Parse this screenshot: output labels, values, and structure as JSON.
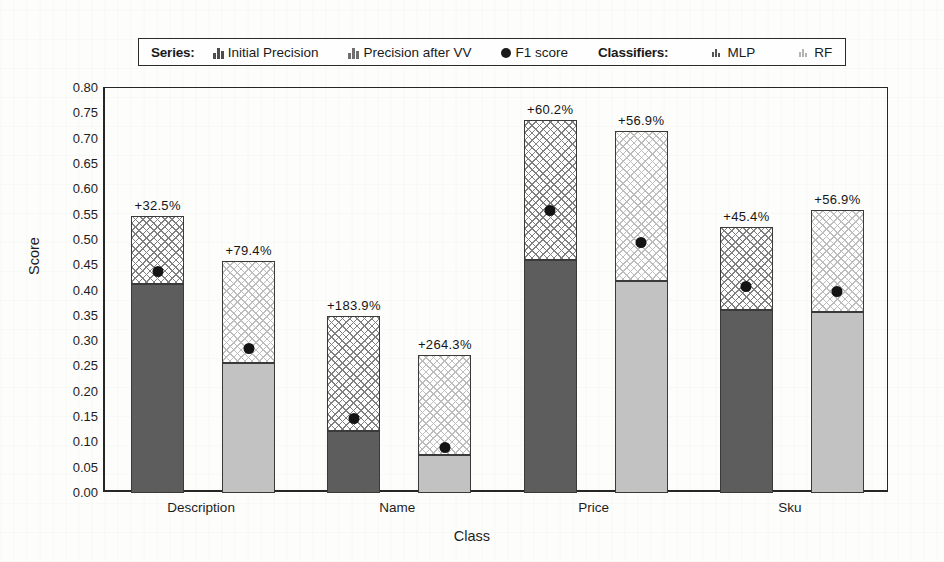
{
  "legend": {
    "series_title": "Series:",
    "classifiers_title": "Classifiers:",
    "series_entries": [
      {
        "label": "Initial Precision",
        "icon": "bar-chart-dark-icon"
      },
      {
        "label": "Precision after VV",
        "icon": "bar-chart-hatched-icon"
      },
      {
        "label": "F1 score",
        "icon": "filled-circle-icon"
      }
    ],
    "classifier_entries": [
      {
        "label": "MLP",
        "icon": "bar-tick-dark-icon",
        "color": "#5d5d5d"
      },
      {
        "label": "RF",
        "icon": "bar-tick-light-icon",
        "color": "#c2c2c2"
      }
    ]
  },
  "chart_data": {
    "type": "bar",
    "title": "",
    "xlabel": "Class",
    "ylabel": "Score",
    "ylim": [
      0.0,
      0.8
    ],
    "ytick_step": 0.05,
    "grid": false,
    "legend_position": "top",
    "stacked": true,
    "categories": [
      "Description",
      "Name",
      "Price",
      "Sku"
    ],
    "yticks": [
      "0.00",
      "0.05",
      "0.10",
      "0.15",
      "0.20",
      "0.25",
      "0.30",
      "0.35",
      "0.40",
      "0.45",
      "0.50",
      "0.55",
      "0.60",
      "0.65",
      "0.70",
      "0.75",
      "0.80"
    ],
    "classifiers": [
      "MLP",
      "RF"
    ],
    "series": [
      {
        "name": "Initial Precision",
        "key": "initial_precision"
      },
      {
        "name": "Precision after VV",
        "key": "precision_after_vv"
      },
      {
        "name": "F1 score",
        "key": "f1_score"
      }
    ],
    "bars": [
      {
        "category": "Description",
        "classifier": "MLP",
        "initial_precision": 0.413,
        "precision_after_vv": 0.547,
        "f1_score": 0.438,
        "growth_label": "+32.5%"
      },
      {
        "category": "Description",
        "classifier": "RF",
        "initial_precision": 0.256,
        "precision_after_vv": 0.459,
        "f1_score": 0.285,
        "growth_label": "+79.4%"
      },
      {
        "category": "Name",
        "classifier": "MLP",
        "initial_precision": 0.123,
        "precision_after_vv": 0.349,
        "f1_score": 0.148,
        "growth_label": "+183.9%"
      },
      {
        "category": "Name",
        "classifier": "RF",
        "initial_precision": 0.075,
        "precision_after_vv": 0.273,
        "f1_score": 0.09,
        "growth_label": "+264.3%"
      },
      {
        "category": "Price",
        "classifier": "MLP",
        "initial_precision": 0.46,
        "precision_after_vv": 0.737,
        "f1_score": 0.559,
        "growth_label": "+60.2%"
      },
      {
        "category": "Price",
        "classifier": "RF",
        "initial_precision": 0.418,
        "precision_after_vv": 0.716,
        "f1_score": 0.494,
        "growth_label": "+56.9%"
      },
      {
        "category": "Sku",
        "classifier": "MLP",
        "initial_precision": 0.362,
        "precision_after_vv": 0.526,
        "f1_score": 0.407,
        "growth_label": "+45.4%"
      },
      {
        "category": "Sku",
        "classifier": "RF",
        "initial_precision": 0.357,
        "precision_after_vv": 0.56,
        "f1_score": 0.398,
        "growth_label": "+56.9%"
      }
    ]
  },
  "style": {
    "mlp_solid": "#5d5d5d",
    "rf_solid": "#c2c2c2",
    "mlp_hatch": "#808080",
    "rf_hatch": "#bdbdbd",
    "axis": "#262626",
    "dot": "#141414"
  }
}
